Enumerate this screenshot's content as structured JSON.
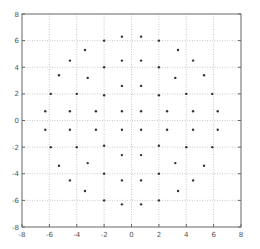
{
  "chart_data": {
    "type": "scatter",
    "title": "",
    "xlabel": "",
    "ylabel": "",
    "xlim": [
      -8,
      8
    ],
    "ylim": [
      -8,
      8
    ],
    "grid": true,
    "legend": null,
    "x_ticks": [
      "-8",
      "-6",
      "-4",
      "-2",
      "0",
      "2",
      "4",
      "6",
      "8"
    ],
    "y_ticks": [
      "-8",
      "-6",
      "-4",
      "-2",
      "0",
      "2",
      "4",
      "6",
      "8"
    ],
    "marker": "dot",
    "marker_color": "#333333",
    "series": [
      {
        "name": "constellation",
        "points": [
          [
            -0.7,
            6.3
          ],
          [
            0.7,
            6.3
          ],
          [
            -2.0,
            6.0
          ],
          [
            2.0,
            6.0
          ],
          [
            -3.4,
            5.3
          ],
          [
            3.4,
            5.3
          ],
          [
            -4.5,
            4.5
          ],
          [
            -0.7,
            4.5
          ],
          [
            0.7,
            4.5
          ],
          [
            4.5,
            4.5
          ],
          [
            -2.0,
            4.0
          ],
          [
            2.0,
            4.0
          ],
          [
            -5.3,
            3.4
          ],
          [
            5.3,
            3.4
          ],
          [
            -3.2,
            3.2
          ],
          [
            3.2,
            3.2
          ],
          [
            -0.7,
            2.6
          ],
          [
            0.7,
            2.6
          ],
          [
            -5.9,
            2.0
          ],
          [
            -4.0,
            2.0
          ],
          [
            -2.0,
            1.9
          ],
          [
            2.0,
            1.9
          ],
          [
            4.0,
            2.0
          ],
          [
            5.9,
            2.0
          ],
          [
            -6.3,
            0.7
          ],
          [
            -4.5,
            0.7
          ],
          [
            -2.6,
            0.7
          ],
          [
            -0.7,
            0.7
          ],
          [
            0.7,
            0.7
          ],
          [
            2.6,
            0.7
          ],
          [
            4.5,
            0.7
          ],
          [
            6.3,
            0.7
          ],
          [
            -6.3,
            -0.7
          ],
          [
            -4.5,
            -0.7
          ],
          [
            -2.6,
            -0.7
          ],
          [
            -0.7,
            -0.7
          ],
          [
            0.7,
            -0.7
          ],
          [
            2.6,
            -0.7
          ],
          [
            4.5,
            -0.7
          ],
          [
            6.3,
            -0.7
          ],
          [
            -5.9,
            -2.0
          ],
          [
            -4.0,
            -2.0
          ],
          [
            -2.0,
            -1.9
          ],
          [
            2.0,
            -1.9
          ],
          [
            4.0,
            -2.0
          ],
          [
            5.9,
            -2.0
          ],
          [
            -0.7,
            -2.6
          ],
          [
            0.7,
            -2.6
          ],
          [
            -5.3,
            -3.4
          ],
          [
            5.3,
            -3.4
          ],
          [
            -3.2,
            -3.2
          ],
          [
            3.2,
            -3.2
          ],
          [
            -2.0,
            -4.0
          ],
          [
            2.0,
            -4.0
          ],
          [
            -4.5,
            -4.5
          ],
          [
            -0.7,
            -4.5
          ],
          [
            0.7,
            -4.5
          ],
          [
            4.5,
            -4.5
          ],
          [
            -3.4,
            -5.3
          ],
          [
            3.4,
            -5.3
          ],
          [
            -2.0,
            -6.0
          ],
          [
            2.0,
            -6.0
          ],
          [
            -0.7,
            -6.3
          ],
          [
            0.7,
            -6.3
          ]
        ]
      }
    ]
  }
}
